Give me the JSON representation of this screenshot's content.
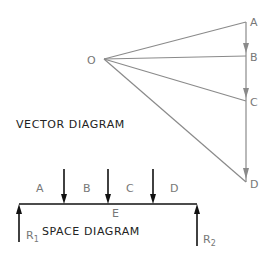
{
  "vector_diagram": {
    "title": "VECTOR DIAGRAM",
    "pole_label": "O",
    "points": [
      {
        "label": "A"
      },
      {
        "label": "B"
      },
      {
        "label": "C"
      },
      {
        "label": "D"
      }
    ]
  },
  "space_diagram": {
    "title": "SPACE DIAGRAM",
    "space_labels": [
      "A",
      "B",
      "C",
      "D"
    ],
    "beam_label": "E",
    "reaction_left": {
      "main": "R",
      "sub": "1"
    },
    "reaction_right": {
      "main": "R",
      "sub": "2"
    }
  },
  "colors": {
    "vector_lines": "#8a8a8a",
    "beam": "#111111",
    "labels": "#777777"
  }
}
